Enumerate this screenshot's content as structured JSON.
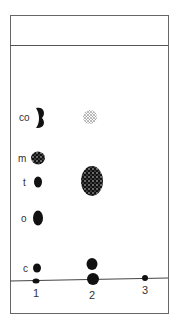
{
  "figure": {
    "type": "thin-layer chromatogram",
    "ink_color": "#111111",
    "frame_color": "#555555",
    "spot_labels": [
      "co",
      "m",
      "t",
      "o",
      "c"
    ],
    "lane_labels": [
      "1",
      "2",
      "3"
    ],
    "lanes": [
      {
        "lane": "1",
        "spots": [
          {
            "label": "co",
            "style": "solid-crescent"
          },
          {
            "label": "m",
            "style": "solid-speckled"
          },
          {
            "label": "t",
            "style": "solid"
          },
          {
            "label": "o",
            "style": "solid"
          },
          {
            "label": "c",
            "style": "solid"
          },
          {
            "label": "origin",
            "style": "solid-small"
          }
        ]
      },
      {
        "lane": "2",
        "spots": [
          {
            "label": "co-level",
            "style": "faint-speckled"
          },
          {
            "label": "t-level",
            "style": "large-speckled"
          },
          {
            "label": "near-origin",
            "style": "solid"
          },
          {
            "label": "origin",
            "style": "solid"
          }
        ]
      },
      {
        "lane": "3",
        "spots": [
          {
            "label": "origin",
            "style": "solid-small"
          }
        ]
      }
    ]
  }
}
